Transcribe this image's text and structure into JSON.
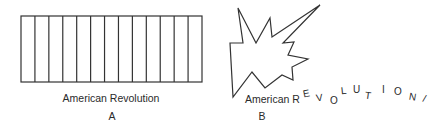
{
  "figure_a": {
    "caption": "American Revolution",
    "letter": "A",
    "columns": 13,
    "stroke_color": "#333333"
  },
  "figure_b": {
    "caption_prefix": "American R",
    "arc_letters": [
      "E",
      "V",
      "O",
      "L",
      "U",
      "T",
      "I",
      "O",
      "N",
      "/"
    ],
    "letter": "B",
    "stroke_color": "#333333"
  }
}
